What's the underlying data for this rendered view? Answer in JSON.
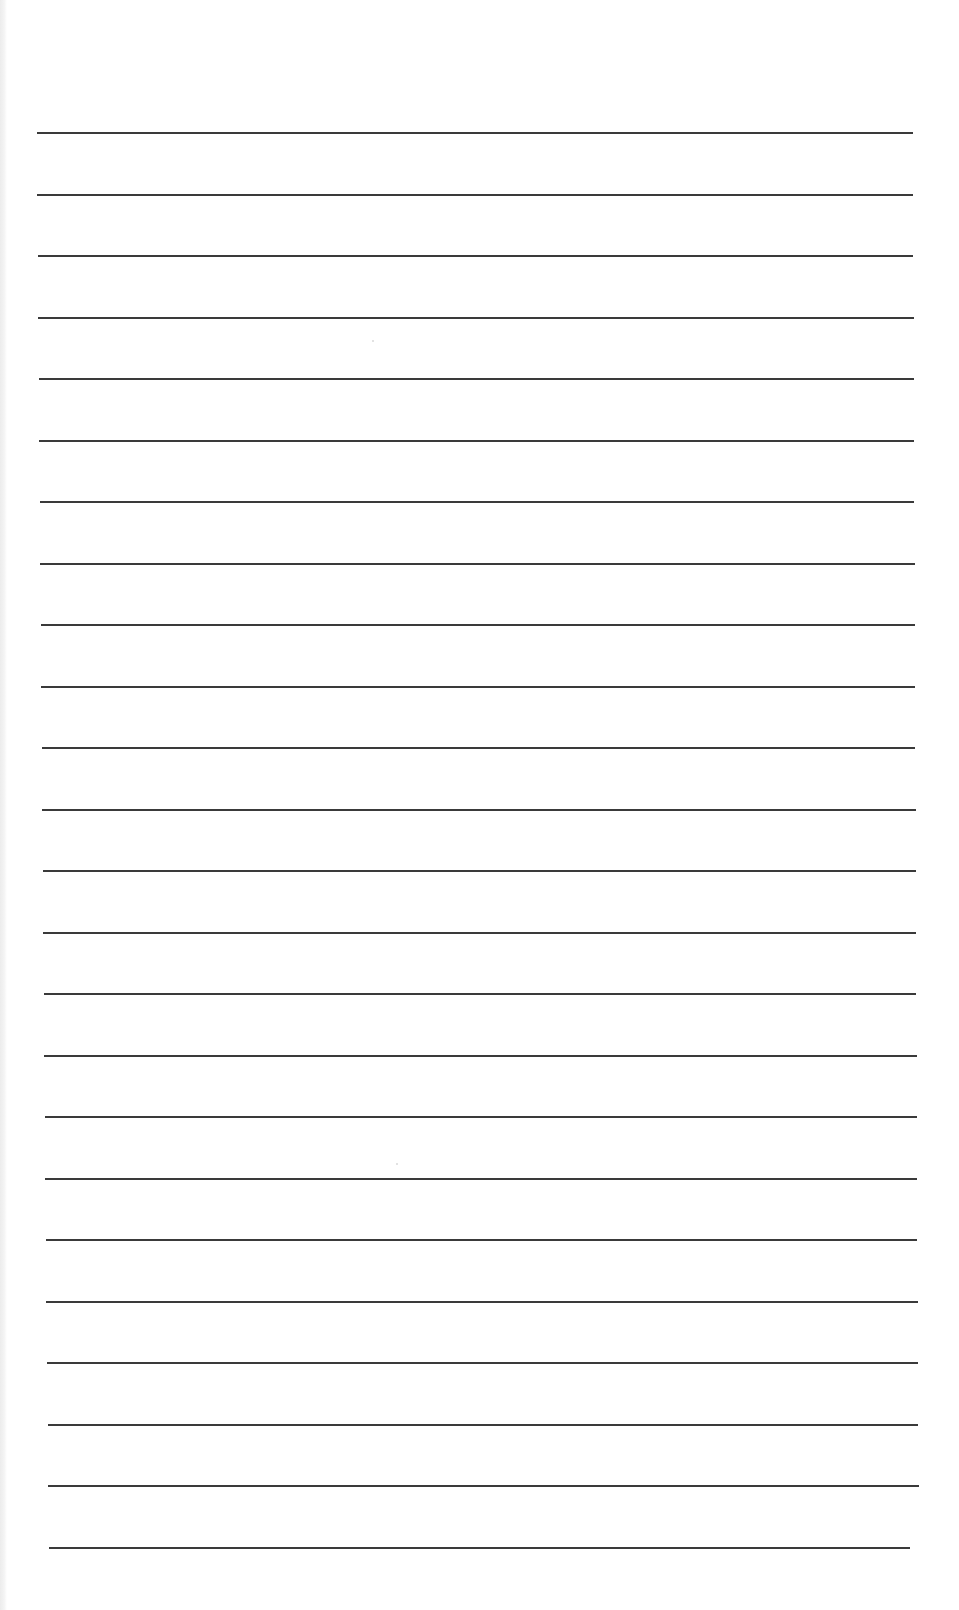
{
  "document": {
    "type": "lined-paper",
    "background_color": "#ffffff",
    "line_color": "#3a3a3a",
    "line_count": 24,
    "first_line_y": 132,
    "line_spacing": 61.5,
    "line_thickness": 2,
    "lines": [
      {
        "left": 37,
        "right": 913
      },
      {
        "left": 37,
        "right": 913
      },
      {
        "left": 38,
        "right": 913
      },
      {
        "left": 38,
        "right": 914
      },
      {
        "left": 39,
        "right": 914
      },
      {
        "left": 39,
        "right": 914
      },
      {
        "left": 40,
        "right": 914
      },
      {
        "left": 40,
        "right": 915
      },
      {
        "left": 41,
        "right": 915
      },
      {
        "left": 41,
        "right": 915
      },
      {
        "left": 42,
        "right": 915
      },
      {
        "left": 42,
        "right": 916
      },
      {
        "left": 43,
        "right": 916
      },
      {
        "left": 43,
        "right": 916
      },
      {
        "left": 44,
        "right": 916
      },
      {
        "left": 44,
        "right": 917
      },
      {
        "left": 45,
        "right": 917
      },
      {
        "left": 45,
        "right": 917
      },
      {
        "left": 46,
        "right": 917
      },
      {
        "left": 46,
        "right": 918
      },
      {
        "left": 47,
        "right": 918
      },
      {
        "left": 48,
        "right": 918
      },
      {
        "left": 48,
        "right": 919
      },
      {
        "left": 49,
        "right": 910
      }
    ]
  }
}
